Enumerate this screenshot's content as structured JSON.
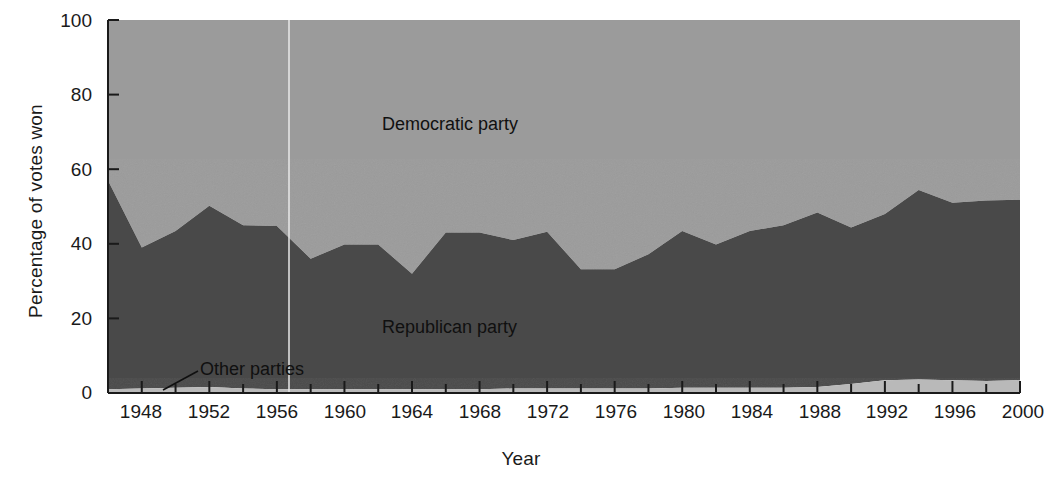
{
  "chart_data": {
    "type": "area",
    "title": "",
    "xlabel": "Year",
    "ylabel": "Percentage of votes won",
    "stacked": true,
    "stack_order": [
      "Other parties",
      "Republican party",
      "Democratic party"
    ],
    "grid": false,
    "legend_position": "inline-annotations",
    "xlim": [
      1946,
      2000
    ],
    "ylim": [
      0,
      100
    ],
    "ytick_labels": [
      "0",
      "20",
      "40",
      "60",
      "80",
      "100"
    ],
    "ytick_values": [
      0,
      20,
      40,
      60,
      80,
      100
    ],
    "xtick_labels": [
      "1948",
      "1952",
      "1956",
      "1960",
      "1964",
      "1968",
      "1972",
      "1976",
      "1980",
      "1984",
      "1988",
      "1992",
      "1996",
      "2000"
    ],
    "xtick_values": [
      1948,
      1952,
      1956,
      1960,
      1964,
      1968,
      1972,
      1976,
      1980,
      1984,
      1988,
      1992,
      1996,
      2000
    ],
    "minor_tick_interval": 2,
    "x": [
      1946,
      1948,
      1950,
      1952,
      1954,
      1956,
      1958,
      1960,
      1962,
      1964,
      1966,
      1968,
      1970,
      1972,
      1974,
      1976,
      1978,
      1980,
      1982,
      1984,
      1986,
      1988,
      1990,
      1992,
      1994,
      1996,
      1998,
      2000
    ],
    "series": [
      {
        "name": "Other parties",
        "color": "#b9b9b9",
        "values": [
          1.0,
          1.2,
          1.4,
          1.6,
          1.2,
          1.0,
          1.0,
          1.0,
          1.0,
          1.0,
          1.0,
          1.0,
          1.2,
          1.2,
          1.2,
          1.2,
          1.2,
          1.4,
          1.4,
          1.4,
          1.4,
          1.6,
          2.4,
          3.4,
          3.6,
          3.4,
          3.2,
          3.4
        ]
      },
      {
        "name": "Republican party",
        "color": "#4a4a4a",
        "values": [
          56.0,
          37.8,
          42.0,
          48.6,
          43.8,
          43.8,
          35.0,
          38.8,
          38.8,
          31.0,
          42.0,
          42.0,
          39.8,
          42.0,
          32.0,
          32.0,
          36.0,
          42.0,
          38.4,
          42.0,
          43.6,
          46.8,
          42.0,
          44.6,
          50.8,
          47.6,
          48.4,
          48.4
        ]
      },
      {
        "name": "Democratic party",
        "color": "#9b9b9b",
        "values": [
          43.0,
          61.0,
          56.6,
          49.8,
          55.0,
          55.2,
          64.0,
          60.2,
          60.2,
          68.0,
          57.0,
          57.0,
          59.0,
          56.8,
          66.8,
          66.8,
          62.8,
          56.6,
          60.2,
          56.6,
          55.0,
          51.6,
          55.6,
          52.0,
          45.6,
          49.0,
          48.4,
          48.2
        ]
      }
    ],
    "annotations": [
      {
        "name": "democratic-party-label",
        "text": "Democratic party",
        "x_px": 382,
        "y_px": 114
      },
      {
        "name": "republican-party-label",
        "text": "Republican party",
        "x_px": 382,
        "y_px": 317
      },
      {
        "name": "other-parties-label",
        "text": "Other parties",
        "x_px": 200,
        "y_px": 359,
        "leader_line": true
      }
    ],
    "colors": {
      "democratic": "#9b9b9b",
      "republican": "#4a4a4a",
      "other": "#b9b9b9",
      "axis": "#1a1a1a",
      "background": "#ffffff"
    }
  }
}
